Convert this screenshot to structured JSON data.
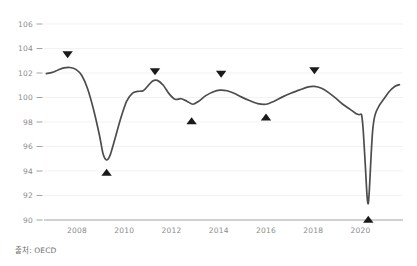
{
  "chart_data": {
    "type": "line",
    "title": "",
    "subtitle": "",
    "xlabel": "",
    "ylabel": "",
    "xlim": [
      2006.6,
      2021.8
    ],
    "ylim": [
      90,
      106
    ],
    "grid": true,
    "legend": false,
    "y_ticks": [
      90,
      92,
      94,
      96,
      98,
      100,
      102,
      104,
      106
    ],
    "y_tick_labels": [
      "90",
      "92",
      "94",
      "96",
      "98",
      "100",
      "102",
      "104",
      "106"
    ],
    "x_ticks": [
      2008,
      2010,
      2012,
      2014,
      2016,
      2018,
      2020
    ],
    "x_tick_labels": [
      "2008",
      "2010",
      "2012",
      "2014",
      "2016",
      "2018",
      "2020"
    ],
    "series": [
      {
        "name": "OECD composite leading indicator",
        "color": "#4d4d4d",
        "points": [
          [
            2006.7,
            101.95
          ],
          [
            2006.95,
            102.05
          ],
          [
            2007.2,
            102.25
          ],
          [
            2007.45,
            102.42
          ],
          [
            2007.7,
            102.45
          ],
          [
            2007.95,
            102.3
          ],
          [
            2008.2,
            101.8
          ],
          [
            2008.45,
            100.7
          ],
          [
            2008.7,
            99.0
          ],
          [
            2008.95,
            96.9
          ],
          [
            2009.1,
            95.4
          ],
          [
            2009.25,
            94.9
          ],
          [
            2009.4,
            95.3
          ],
          [
            2009.6,
            96.6
          ],
          [
            2009.85,
            98.3
          ],
          [
            2010.1,
            99.7
          ],
          [
            2010.35,
            100.35
          ],
          [
            2010.55,
            100.5
          ],
          [
            2010.8,
            100.55
          ],
          [
            2011.0,
            100.95
          ],
          [
            2011.2,
            101.35
          ],
          [
            2011.4,
            101.4
          ],
          [
            2011.65,
            101.0
          ],
          [
            2011.9,
            100.3
          ],
          [
            2012.15,
            99.85
          ],
          [
            2012.4,
            99.9
          ],
          [
            2012.65,
            99.7
          ],
          [
            2012.9,
            99.45
          ],
          [
            2013.15,
            99.7
          ],
          [
            2013.45,
            100.15
          ],
          [
            2013.75,
            100.45
          ],
          [
            2014.05,
            100.6
          ],
          [
            2014.35,
            100.55
          ],
          [
            2014.65,
            100.35
          ],
          [
            2014.95,
            100.05
          ],
          [
            2015.3,
            99.75
          ],
          [
            2015.65,
            99.5
          ],
          [
            2016.0,
            99.45
          ],
          [
            2016.35,
            99.7
          ],
          [
            2016.7,
            100.05
          ],
          [
            2017.05,
            100.35
          ],
          [
            2017.4,
            100.6
          ],
          [
            2017.75,
            100.85
          ],
          [
            2018.05,
            100.9
          ],
          [
            2018.35,
            100.75
          ],
          [
            2018.65,
            100.4
          ],
          [
            2018.95,
            99.95
          ],
          [
            2019.25,
            99.45
          ],
          [
            2019.55,
            99.05
          ],
          [
            2019.8,
            98.7
          ],
          [
            2019.95,
            98.6
          ],
          [
            2020.05,
            98.55
          ],
          [
            2020.12,
            97.2
          ],
          [
            2020.2,
            94.6
          ],
          [
            2020.28,
            91.9
          ],
          [
            2020.33,
            91.35
          ],
          [
            2020.38,
            92.6
          ],
          [
            2020.45,
            95.3
          ],
          [
            2020.52,
            97.4
          ],
          [
            2020.62,
            98.6
          ],
          [
            2020.78,
            99.3
          ],
          [
            2020.98,
            99.85
          ],
          [
            2021.2,
            100.45
          ],
          [
            2021.45,
            100.9
          ],
          [
            2021.65,
            101.05
          ]
        ]
      }
    ],
    "markers": [
      {
        "name": "peak-2007",
        "x": 2007.6,
        "y": 103.55,
        "direction": "down",
        "value_at": 102.45
      },
      {
        "name": "trough-2009",
        "x": 2009.25,
        "y": 93.85,
        "direction": "up",
        "value_at": 94.9
      },
      {
        "name": "peak-2011",
        "x": 2011.3,
        "y": 102.15,
        "direction": "down",
        "value_at": 101.4
      },
      {
        "name": "trough-2012",
        "x": 2012.85,
        "y": 98.05,
        "direction": "up",
        "value_at": 99.45
      },
      {
        "name": "peak-2014",
        "x": 2014.1,
        "y": 101.95,
        "direction": "down",
        "value_at": 100.6
      },
      {
        "name": "trough-2016",
        "x": 2016.0,
        "y": 98.35,
        "direction": "up",
        "value_at": 99.45
      },
      {
        "name": "peak-2018",
        "x": 2018.05,
        "y": 102.25,
        "direction": "down",
        "value_at": 100.9
      },
      {
        "name": "trough-2020",
        "x": 2020.33,
        "y": 90.0,
        "direction": "up",
        "value_at": 91.35
      }
    ]
  },
  "footer": {
    "source_note": "출처: OECD"
  }
}
